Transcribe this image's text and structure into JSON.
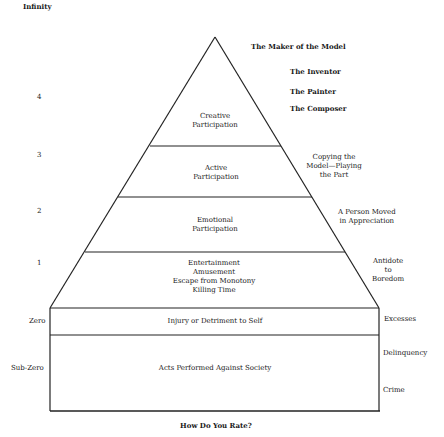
{
  "diagram": {
    "top_label": "Infinity",
    "caption": "How Do You Rate?",
    "levels": [
      {
        "scale": "4",
        "tier": "Creative\nParticipation",
        "examples": [
          "The Maker of the Model",
          "The Inventor",
          "The Painter",
          "The Composer"
        ]
      },
      {
        "scale": "3",
        "tier": "Active\nParticipation",
        "examples": [
          "Copying the\nModel—Playing\nthe Part"
        ]
      },
      {
        "scale": "2",
        "tier": "Emotional\nParticipation",
        "examples": [
          "A Person Moved\nin Appreciation"
        ]
      },
      {
        "scale": "1",
        "tier": "Entertainment\nAmusement\nEscape from Monotony\nKilling Time",
        "examples": [
          "Antidote\nto\nBoredom"
        ]
      },
      {
        "scale": "Zero",
        "tier": "Injury or Detriment to Self",
        "examples": [
          "Excesses"
        ]
      },
      {
        "scale": "Sub-Zero",
        "tier": "Acts Performed Against Society",
        "examples": [
          "Delinquency",
          "Crime"
        ]
      }
    ]
  }
}
